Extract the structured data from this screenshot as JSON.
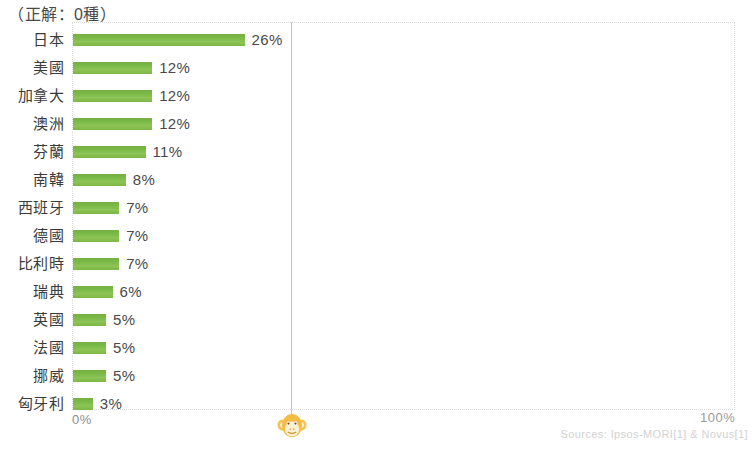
{
  "chart_data": {
    "type": "bar",
    "orientation": "horizontal",
    "title": "（正解：0種）",
    "xlabel": "",
    "ylabel": "",
    "xlim": [
      0,
      100
    ],
    "grid": false,
    "legend": null,
    "categories": [
      "日本",
      "美國",
      "加拿大",
      "澳洲",
      "芬蘭",
      "南韓",
      "西班牙",
      "德國",
      "比利時",
      "瑞典",
      "英國",
      "法國",
      "挪威",
      "匈牙利"
    ],
    "values": [
      26,
      12,
      12,
      12,
      11,
      8,
      7,
      7,
      7,
      6,
      5,
      5,
      5,
      3
    ],
    "value_labels": [
      "26%",
      "12%",
      "12%",
      "12%",
      "11%",
      "8%",
      "7%",
      "7%",
      "7%",
      "6%",
      "5%",
      "5%",
      "5%",
      "3%"
    ],
    "bar_color": "#7cba4a",
    "annotations": {
      "guideline_color": "#f2c249",
      "guideline_value": 33
    }
  },
  "axis": {
    "min_label": "0%",
    "max_label": "100%"
  },
  "footer": {
    "source": "Sources: Ipsos-MORI[1] & Novus[1]"
  },
  "icons": {
    "monkey": "monkey-face-icon"
  }
}
